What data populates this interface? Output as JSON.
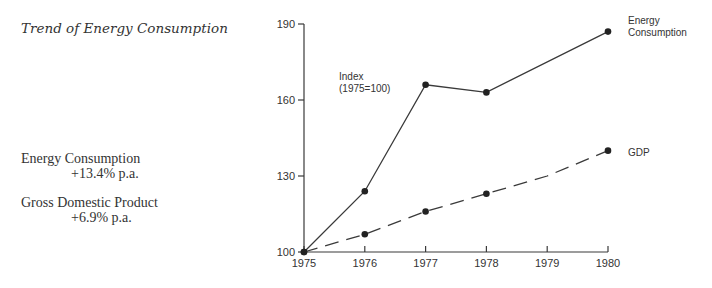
{
  "left_panel": {
    "title": "Trend of Energy Consumption",
    "stats": [
      {
        "label": "Energy Consumption",
        "value": "+13.4% p.a."
      },
      {
        "label": "Gross Domestic Product",
        "value": "+6.9% p.a."
      }
    ]
  },
  "chart_annotation": {
    "line1": "Index",
    "line2": "(1975=100)"
  },
  "legend": {
    "energy_line1": "Energy",
    "energy_line2": "Consumption",
    "gdp": "GDP"
  },
  "chart_data": {
    "type": "line",
    "title": "Trend of Energy Consumption",
    "xlabel": "",
    "ylabel": "Index (1975=100)",
    "x": [
      1975,
      1976,
      1977,
      1978,
      1979,
      1980
    ],
    "x_ticks": [
      "1975",
      "1976",
      "1977",
      "1978",
      "1979",
      "1980"
    ],
    "y_ticks": [
      "100",
      "130",
      "160",
      "190"
    ],
    "ylim": [
      100,
      190
    ],
    "grid": false,
    "series": [
      {
        "name": "Energy Consumption",
        "style": "solid",
        "x": [
          1975,
          1976,
          1977,
          1978,
          1980
        ],
        "values": [
          100,
          124,
          166,
          163,
          187
        ],
        "markers": [
          true,
          true,
          true,
          true,
          true
        ]
      },
      {
        "name": "GDP",
        "style": "dashed",
        "x": [
          1975,
          1976,
          1977,
          1978,
          1979,
          1980
        ],
        "values": [
          100,
          107,
          116,
          123,
          130,
          140
        ],
        "markers": [
          true,
          true,
          true,
          true,
          false,
          true
        ]
      }
    ],
    "annotations": [
      "Index (1975=100)",
      "Energy Consumption +13.4% p.a.",
      "Gross Domestic Product +6.9% p.a."
    ],
    "legend_position": "line-end labels"
  }
}
